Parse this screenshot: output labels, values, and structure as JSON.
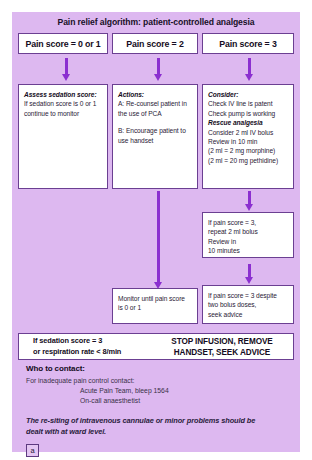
{
  "figure": {
    "title": "Pain relief algorithm: patient-controlled analgesia",
    "label": "a"
  },
  "columns": [
    {
      "header": "Pain score = 0 or 1",
      "box": {
        "heading": "Assess sedation score:",
        "lines": [
          "If sedation score is 0 or 1",
          "continue to monitor"
        ]
      }
    },
    {
      "header": "Pain score = 2",
      "box": {
        "heading": "Actions:",
        "lines": [
          "A: Re-counsel patient in",
          "the use of PCA",
          "",
          "B: Encourage patient to",
          "use handset"
        ]
      },
      "outcome": {
        "lines": [
          "Monitor until pain score",
          "is 0 or 1"
        ]
      }
    },
    {
      "header": "Pain score = 3",
      "box": {
        "heading": "Consider:",
        "lines_before": [
          "Check IV line is patent",
          "Check pump is working"
        ],
        "subheading": "Rescue analgesia",
        "lines_after": [
          "Consider 2 ml IV bolus",
          "Review in 10 min",
          "(2 ml = 2 mg morphine)",
          "(2 ml = 20 mg pethidine)"
        ]
      },
      "step2": {
        "lines": [
          "If pain score = 3,",
          "repeat 2 ml bolus",
          "Review in",
          "10 minutes"
        ]
      },
      "step3": {
        "lines": [
          "If pain score = 3 despite",
          "two bolus doses,",
          "seek advice"
        ]
      }
    }
  ],
  "alert": {
    "condition_lines": [
      "If sedation score = 3",
      "or respiration rate < 8/min"
    ],
    "action_lines": [
      "STOP INFUSION, REMOVE",
      "HANDSET, SEEK ADVICE"
    ]
  },
  "contact": {
    "heading": "Who to contact:",
    "lines": [
      "For inadequate pain control contact:"
    ],
    "indented_lines": [
      "Acute Pain Team, bleep 1564",
      "On-call anaesthetist"
    ]
  },
  "footnote": {
    "lines": [
      "The re-siting of intravenous cannulae or minor problems should be",
      "dealt with at ward level."
    ]
  },
  "colors": {
    "panel_background": "#ddb8f0",
    "arrow": "#8b2fd0",
    "box_border": "#6b3f92",
    "text": "#2a2136"
  }
}
